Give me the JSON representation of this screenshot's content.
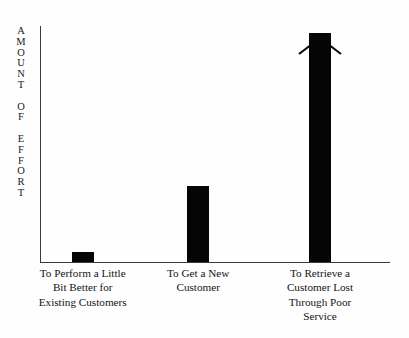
{
  "figure": {
    "name": "amount-of-effort-bar-chart",
    "background_color": "#fefefe",
    "ink_color": "#050505",
    "axis_color": "#3a3a3a"
  },
  "y_axis": {
    "title": "AMOUNT OF EFFORT",
    "letters": [
      "A",
      "M",
      "O",
      "U",
      "N",
      "T",
      "",
      "O",
      "F",
      "",
      "E",
      "F",
      "F",
      "O",
      "R",
      "T"
    ],
    "ticks": [],
    "tick_labels": []
  },
  "x_axis": {
    "title": "",
    "categories": [
      {
        "id": "existing-customers",
        "lines": [
          "To Perform a Little",
          "Bit Better for",
          "Existing Customers"
        ],
        "text": "To Perform a Little Bit Better for Existing Customers"
      },
      {
        "id": "new-customer",
        "lines": [
          "To Get a New",
          "Customer"
        ],
        "text": "To Get a New Customer"
      },
      {
        "id": "retrieve-lost-customer",
        "lines": [
          "To Retrieve a",
          "Customer Lost",
          "Through Poor",
          "Service"
        ],
        "text": "To Retrieve a Customer Lost Through Poor Service"
      }
    ]
  },
  "annotations": [
    {
      "id": "bar-3-arrowhead",
      "type": "arrowhead-up",
      "attached_to": "retrieve-lost-customer",
      "meaning": "value extends beyond chart"
    }
  ],
  "chart_data": {
    "type": "bar",
    "title": "",
    "subtitle": "",
    "xlabel": "",
    "ylabel": "AMOUNT OF EFFORT",
    "categories": [
      "To Perform a Little Bit Better for Existing Customers",
      "To Get a New Customer",
      "To Retrieve a Customer Lost Through Poor Service"
    ],
    "values": [
      4,
      31,
      94
    ],
    "ylim": [
      0,
      100
    ],
    "xlim": null,
    "grid": false,
    "legend": null,
    "bar_color": "#050505",
    "annotations": [
      {
        "category": "To Retrieve a Customer Lost Through Poor Service",
        "marker": "up-arrowhead",
        "note": "bar capped with arrowhead indicating effort continues off-scale"
      }
    ]
  }
}
